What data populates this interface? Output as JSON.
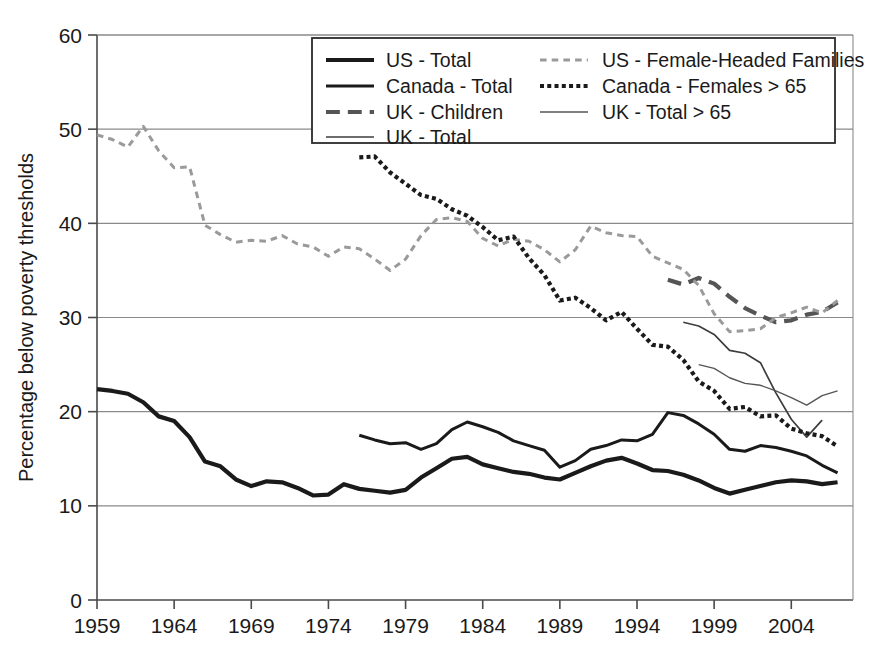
{
  "chart_data": {
    "type": "line",
    "title": "",
    "xlabel": "",
    "ylabel": "Percentage below poverty thresholds",
    "xlim": [
      1959,
      2008
    ],
    "ylim": [
      0,
      60
    ],
    "ytick_values": [
      0,
      10,
      20,
      30,
      40,
      50,
      60
    ],
    "ytick_labels": [
      "0",
      "10",
      "20",
      "30",
      "40",
      "50",
      "60"
    ],
    "xtick_values": [
      1959,
      1964,
      1969,
      1974,
      1979,
      1984,
      1989,
      1994,
      1999,
      2004
    ],
    "xtick_labels": [
      "1959",
      "1964",
      "1969",
      "1974",
      "1979",
      "1984",
      "1989",
      "1994",
      "1999",
      "2004"
    ],
    "grid": "horizontal",
    "legend_position": "top-center",
    "series": [
      {
        "name": "US - Total",
        "style": "solid",
        "color": "#1a1a1a",
        "width": 4.2,
        "x": [
          1959,
          1960,
          1961,
          1962,
          1963,
          1964,
          1965,
          1966,
          1967,
          1968,
          1969,
          1970,
          1971,
          1972,
          1973,
          1974,
          1975,
          1976,
          1977,
          1978,
          1979,
          1980,
          1981,
          1982,
          1983,
          1984,
          1985,
          1986,
          1987,
          1988,
          1989,
          1990,
          1991,
          1992,
          1993,
          1994,
          1995,
          1996,
          1997,
          1998,
          1999,
          2000,
          2001,
          2002,
          2003,
          2004,
          2005,
          2006,
          2007
        ],
        "values": [
          22.4,
          22.2,
          21.9,
          21.0,
          19.5,
          19.0,
          17.3,
          14.7,
          14.2,
          12.8,
          12.1,
          12.6,
          12.5,
          11.9,
          11.1,
          11.2,
          12.3,
          11.8,
          11.6,
          11.4,
          11.7,
          13.0,
          14.0,
          15.0,
          15.2,
          14.4,
          14.0,
          13.6,
          13.4,
          13.0,
          12.8,
          13.5,
          14.2,
          14.8,
          15.1,
          14.5,
          13.8,
          13.7,
          13.3,
          12.7,
          11.9,
          11.3,
          11.7,
          12.1,
          12.5,
          12.7,
          12.6,
          12.3,
          12.5
        ]
      },
      {
        "name": "Canada - Total",
        "style": "solid",
        "color": "#1a1a1a",
        "width": 3.0,
        "x": [
          1976,
          1977,
          1978,
          1979,
          1980,
          1981,
          1982,
          1983,
          1984,
          1985,
          1986,
          1987,
          1988,
          1989,
          1990,
          1991,
          1992,
          1993,
          1994,
          1995,
          1996,
          1997,
          1998,
          1999,
          2000,
          2001,
          2002,
          2003,
          2004,
          2005,
          2006,
          2007
        ],
        "values": [
          17.5,
          17.0,
          16.6,
          16.7,
          16.0,
          16.6,
          18.1,
          18.9,
          18.4,
          17.8,
          16.9,
          16.4,
          15.9,
          14.1,
          14.8,
          16.0,
          16.4,
          17.0,
          16.9,
          17.6,
          19.9,
          19.6,
          18.7,
          17.6,
          16.0,
          15.8,
          16.4,
          16.2,
          15.8,
          15.3,
          14.3,
          13.5
        ]
      },
      {
        "name": "UK - Children",
        "style": "longdash",
        "color": "#555555",
        "width": 4.2,
        "x": [
          1996,
          1997,
          1998,
          1999,
          2000,
          2001,
          2002,
          2003,
          2004,
          2005,
          2006,
          2007
        ],
        "values": [
          34.0,
          33.5,
          34.2,
          33.6,
          32.2,
          31.0,
          30.2,
          29.5,
          29.7,
          30.3,
          30.6,
          31.6
        ]
      },
      {
        "name": "UK - Total",
        "style": "solid",
        "color": "#3d3d3d",
        "width": 1.7,
        "x": [
          1997,
          1998,
          1999,
          2000,
          2001,
          2002,
          2003,
          2004,
          2005,
          2006
        ],
        "values": [
          29.5,
          29.1,
          28.2,
          26.5,
          26.2,
          25.2,
          22.0,
          19.2,
          17.3,
          19.1
        ]
      },
      {
        "name": "US - Female-Headed Families",
        "style": "dash",
        "color": "#9a9a9a",
        "width": 3.0,
        "x": [
          1959,
          1960,
          1961,
          1962,
          1963,
          1964,
          1965,
          1966,
          1967,
          1968,
          1969,
          1970,
          1971,
          1972,
          1973,
          1974,
          1975,
          1976,
          1977,
          1978,
          1979,
          1980,
          1981,
          1982,
          1983,
          1984,
          1985,
          1986,
          1987,
          1988,
          1989,
          1990,
          1991,
          1992,
          1993,
          1994,
          1995,
          1996,
          1997,
          1998,
          1999,
          2000,
          2001,
          2002,
          2003,
          2004,
          2005,
          2006,
          2007
        ],
        "values": [
          49.4,
          48.9,
          48.1,
          50.3,
          47.7,
          45.9,
          46.0,
          39.8,
          38.8,
          38.0,
          38.2,
          38.1,
          38.7,
          37.8,
          37.5,
          36.5,
          37.5,
          37.3,
          36.2,
          35.0,
          36.2,
          38.7,
          40.4,
          40.6,
          40.2,
          38.4,
          37.6,
          38.3,
          38.1,
          37.2,
          35.9,
          37.2,
          39.7,
          39.0,
          38.7,
          38.6,
          36.5,
          35.8,
          35.1,
          33.4,
          30.4,
          28.5,
          28.6,
          28.8,
          30.0,
          30.5,
          31.1,
          30.5,
          31.8
        ]
      },
      {
        "name": "Canada - Females > 65",
        "style": "dot",
        "color": "#1a1a1a",
        "width": 4.2,
        "x": [
          1976,
          1977,
          1978,
          1979,
          1980,
          1981,
          1982,
          1983,
          1984,
          1985,
          1986,
          1987,
          1988,
          1989,
          1990,
          1991,
          1992,
          1993,
          1994,
          1995,
          1996,
          1997,
          1998,
          1999,
          2000,
          2001,
          2002,
          2003,
          2004,
          2005,
          2006,
          2007
        ],
        "values": [
          47.0,
          47.1,
          45.4,
          44.2,
          43.0,
          42.6,
          41.5,
          40.8,
          39.6,
          38.2,
          38.6,
          36.3,
          34.5,
          31.8,
          32.1,
          31.0,
          29.7,
          30.6,
          28.8,
          27.1,
          26.9,
          25.5,
          23.2,
          22.2,
          20.3,
          20.5,
          19.5,
          19.6,
          18.2,
          17.7,
          17.4,
          16.3
        ]
      },
      {
        "name": "UK - Total > 65",
        "style": "solid",
        "color": "#555555",
        "width": 1.4,
        "x": [
          1998,
          1999,
          2000,
          2001,
          2002,
          2003,
          2004,
          2005,
          2006,
          2007
        ],
        "values": [
          25.0,
          24.6,
          23.6,
          23.0,
          22.8,
          22.2,
          21.5,
          20.7,
          21.7,
          22.2
        ]
      }
    ]
  },
  "legend": {
    "entries": [
      {
        "label": "US - Total",
        "style": "solid",
        "color": "#1a1a1a",
        "width": 4.2
      },
      {
        "label": "US - Female-Headed Families",
        "style": "dash",
        "color": "#9a9a9a",
        "width": 3.0
      },
      {
        "label": "Canada - Total",
        "style": "solid",
        "color": "#1a1a1a",
        "width": 3.0
      },
      {
        "label": "Canada - Females > 65",
        "style": "dot",
        "color": "#1a1a1a",
        "width": 4.2
      },
      {
        "label": "UK - Children",
        "style": "longdash",
        "color": "#555555",
        "width": 4.2
      },
      {
        "label": "UK - Total > 65",
        "style": "solid",
        "color": "#555555",
        "width": 1.4
      },
      {
        "label": "UK - Total",
        "style": "solid",
        "color": "#3d3d3d",
        "width": 1.7
      }
    ]
  },
  "colors": {
    "axis": "#4a4a4a",
    "grid": "#8a8a8a",
    "text": "#1a1a1a",
    "background": "#ffffff"
  }
}
